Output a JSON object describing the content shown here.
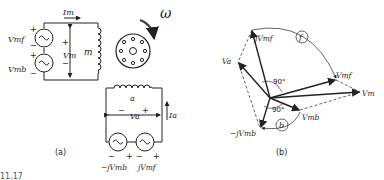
{
  "figure": {
    "caption_fragment": "11.17",
    "panel_a": {
      "label": "(a)",
      "main_circuit": {
        "current_label": "Im",
        "source_top_label": "Vmf",
        "source_bottom_label": "Vmb",
        "voltage_label": "Vm",
        "winding_label": "m",
        "plus": "+",
        "minus": "−"
      },
      "rotor": {
        "rotation_label": "ω"
      },
      "aux_circuit": {
        "winding_label": "a",
        "voltage_label": "Va",
        "current_label": "Ia",
        "source_left_label": "−jVmb",
        "source_right_label": "jVmf",
        "plus": "+",
        "minus": "−"
      }
    },
    "panel_b": {
      "label": "(b)",
      "phasors": {
        "jVmf": "jVmf",
        "Va": "Va",
        "Vmf": "Vmf",
        "Vm": "Vm",
        "Vmb": "Vmb",
        "neg_jVmb": "−jVmb"
      },
      "angles": {
        "upper": "90°",
        "lower": "90°"
      },
      "arcs": {
        "forward": "f",
        "backward": "b"
      }
    }
  }
}
